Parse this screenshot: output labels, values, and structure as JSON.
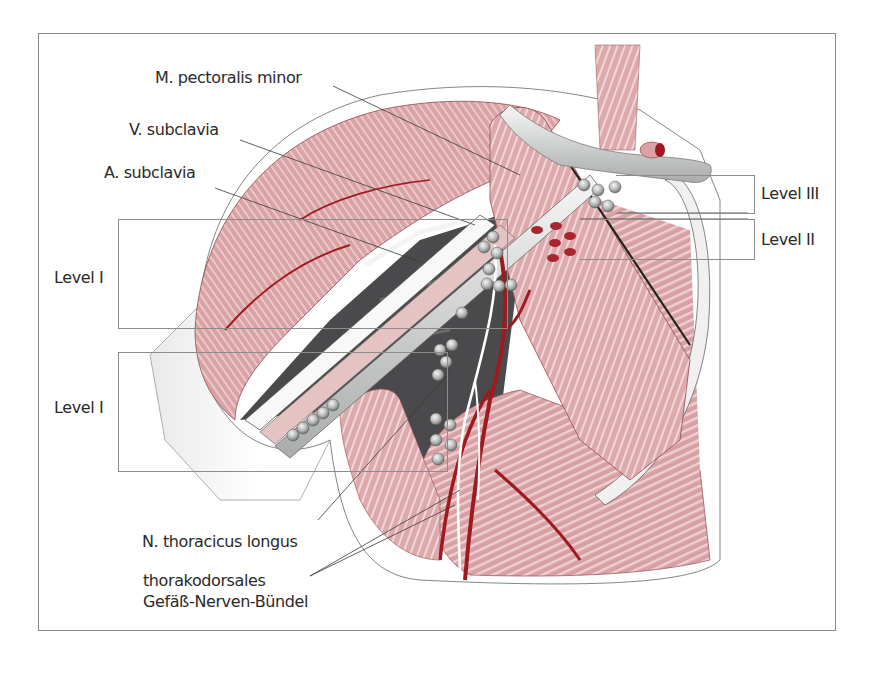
{
  "figure": {
    "labels": {
      "pectoralis_minor": "M. pectoralis minor",
      "v_subclavia": "V. subclavia",
      "a_subclavia": "A. subclavia",
      "level_i_upper": "Level I",
      "level_i_lower": "Level I",
      "level_iii": "Level III",
      "level_ii": "Level II",
      "n_thoracicus_longus": "N.  thoracicus longus",
      "thorakodorsales_line1": "thorakodorsales",
      "thorakodorsales_line2": "Gefäß-Nerven-Bündel"
    },
    "colors": {
      "muscle": "#d9a3a6",
      "muscle_dark": "#b86a70",
      "artery": "#9e1a1f",
      "axilla_dark": "#4a4a4c",
      "vessel_gray": "#d6d8d6",
      "node_gray": "#b9bcbb",
      "frame": "#8a8a8a",
      "text": "#2a2a2a"
    }
  }
}
